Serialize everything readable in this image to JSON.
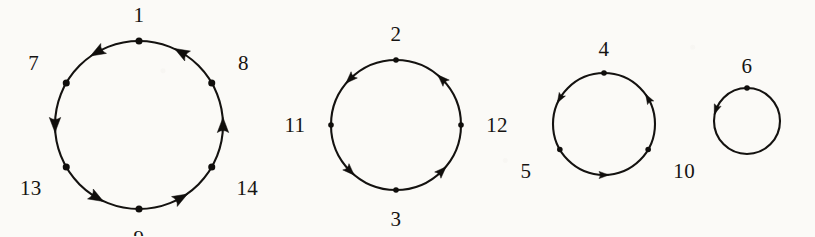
{
  "figure": {
    "kind": "directed-cycle-diagram",
    "background_color": "#fbfaf7",
    "stroke_color": "#141210",
    "label_color": "#161412",
    "arrow_direction": "counterclockwise",
    "width": 815,
    "height": 236
  },
  "cycles": [
    {
      "name": "cycle-1",
      "center_x": 139,
      "center_y": 125,
      "radius": 84,
      "vertex_count": 6,
      "vertices": [
        {
          "label": "1",
          "angle_deg": 270,
          "label_offset": 26,
          "label_dx": 0,
          "label_dy": 0
        },
        {
          "label": "8",
          "angle_deg": 330,
          "label_offset": 32,
          "label_dx": 4,
          "label_dy": -4
        },
        {
          "label": "14",
          "angle_deg": 30,
          "label_offset": 34,
          "label_dx": 6,
          "label_dy": 4
        },
        {
          "label": "9",
          "angle_deg": 90,
          "label_offset": 26,
          "label_dx": 0,
          "label_dy": 3
        },
        {
          "label": "13",
          "angle_deg": 150,
          "label_offset": 34,
          "label_dx": -6,
          "label_dy": 4
        },
        {
          "label": "7",
          "angle_deg": 210,
          "label_offset": 32,
          "label_dx": -5,
          "label_dy": -4
        }
      ],
      "arrow_angles_deg": [
        300,
        0,
        60,
        120,
        180,
        240
      ]
    },
    {
      "name": "cycle-2",
      "center_x": 396,
      "center_y": 125,
      "radius": 65,
      "vertex_count": 4,
      "vertices": [
        {
          "label": "2",
          "angle_deg": 270,
          "label_offset": 26,
          "label_dx": 0,
          "label_dy": 0
        },
        {
          "label": "12",
          "angle_deg": 0,
          "label_offset": 30,
          "label_dx": 6,
          "label_dy": 0
        },
        {
          "label": "3",
          "angle_deg": 90,
          "label_offset": 26,
          "label_dx": 0,
          "label_dy": 3
        },
        {
          "label": "11",
          "angle_deg": 180,
          "label_offset": 30,
          "label_dx": -6,
          "label_dy": 0
        }
      ],
      "arrow_angles_deg": [
        315,
        45,
        135,
        225
      ]
    },
    {
      "name": "cycle-3",
      "center_x": 604,
      "center_y": 124,
      "radius": 51,
      "vertex_count": 3,
      "vertices": [
        {
          "label": "4",
          "angle_deg": 270,
          "label_offset": 24,
          "label_dx": 0,
          "label_dy": 0
        },
        {
          "label": "10",
          "angle_deg": 30,
          "label_offset": 30,
          "label_dx": 10,
          "label_dy": 6
        },
        {
          "label": "5",
          "angle_deg": 150,
          "label_offset": 30,
          "label_dx": -8,
          "label_dy": 6
        }
      ],
      "arrow_angles_deg": [
        330,
        90,
        210
      ]
    },
    {
      "name": "cycle-4",
      "center_x": 747,
      "center_y": 121,
      "radius": 33,
      "vertex_count": 1,
      "vertices": [
        {
          "label": "6",
          "angle_deg": 270,
          "label_offset": 22,
          "label_dx": 0,
          "label_dy": 0
        }
      ],
      "arrow_angles_deg": [
        200
      ]
    }
  ]
}
